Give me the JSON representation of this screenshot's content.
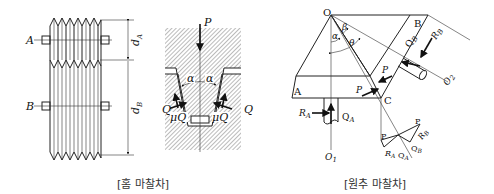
{
  "figures": [
    {
      "id": "grooved",
      "caption": "[홈 마찰차]",
      "labels": {
        "A": "A",
        "B": "B",
        "dA": "d",
        "dA_sub": "A",
        "dB": "d",
        "dB_sub": "B"
      }
    },
    {
      "id": "groove_detail",
      "labels": {
        "P": "P",
        "alpha1": "α",
        "alpha2": "α",
        "Q_left": "Q",
        "Q_right": "Q",
        "muQ_left": "μQ",
        "muQ_right": "μQ"
      }
    },
    {
      "id": "conical",
      "caption": "[원추 마찰차]",
      "labels": {
        "O": "O",
        "A": "A",
        "B": "B",
        "C": "C",
        "alpha": "α",
        "beta": "β",
        "theta": "θ",
        "P1": "P",
        "P2": "P",
        "RA": "R",
        "RA_sub": "A",
        "QA": "Q",
        "QA_sub": "A",
        "RB": "R",
        "RB_sub": "B",
        "QB": "Q",
        "QB_sub": "B",
        "O1": "O",
        "O1_sub": "1",
        "O2": "O",
        "O2_sub": "2",
        "tri_P1": "P",
        "tri_P2": "P",
        "tri_RA": "R",
        "tri_RA_sub": "A",
        "tri_QA": "Q",
        "tri_QA_sub": "A",
        "tri_QB": "Q",
        "tri_QB_sub": "B",
        "tri_RB": "R",
        "tri_RB_sub": "B"
      }
    }
  ]
}
